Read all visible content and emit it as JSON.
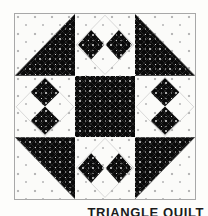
{
  "image": {
    "kind": "quilt-block-diagram",
    "width": 208,
    "height": 216,
    "background_color": "#fdfdfb"
  },
  "caption": {
    "text": "TRIANGLE QUILT",
    "note": "clipped at bottom edge of image"
  },
  "block": {
    "name": "Triangle Quilt block",
    "frame_color": "#a8a8a8",
    "grid_rows": 3,
    "grid_cols": 3
  },
  "fabrics": {
    "dark": {
      "name": "dark-print",
      "base_color": "#0a0a0a",
      "motif_color": "#e1e1e1",
      "description": "near-black ground with small light circular floral motifs on a diagonal lattice"
    },
    "light": {
      "name": "light-print",
      "base_color": "#fbfbf9",
      "motif_color": "#b7b7b7",
      "description": "white ground with scattered small grey dots"
    }
  },
  "cells": [
    {
      "position": "top-left",
      "name": "half-square-triangle",
      "dark_corner": "lower-right",
      "light_corner": "upper-left"
    },
    {
      "position": "top-center",
      "name": "twin-diamonds",
      "orientation": "horizontal",
      "diamond_count": 2,
      "background": "light"
    },
    {
      "position": "top-right",
      "name": "half-square-triangle",
      "dark_corner": "lower-left",
      "light_corner": "upper-right"
    },
    {
      "position": "middle-left",
      "name": "twin-diamonds",
      "orientation": "vertical",
      "diamond_count": 2,
      "background": "light"
    },
    {
      "position": "middle-center",
      "name": "solid-dark-square",
      "background": "dark"
    },
    {
      "position": "middle-right",
      "name": "twin-diamonds",
      "orientation": "vertical",
      "diamond_count": 2,
      "background": "light"
    },
    {
      "position": "bottom-left",
      "name": "half-square-triangle",
      "dark_corner": "upper-right",
      "light_corner": "lower-left"
    },
    {
      "position": "bottom-center",
      "name": "twin-diamonds",
      "orientation": "horizontal",
      "diamond_count": 2,
      "background": "light"
    },
    {
      "position": "bottom-right",
      "name": "half-square-triangle",
      "dark_corner": "upper-left",
      "light_corner": "lower-right"
    }
  ]
}
